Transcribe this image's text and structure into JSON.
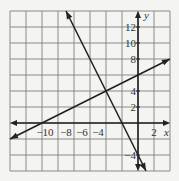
{
  "chart_data": {
    "type": "line",
    "title": "",
    "xlabel": "x",
    "ylabel": "y",
    "xlim": [
      -16,
      4
    ],
    "ylim": [
      -6,
      14
    ],
    "grid": true,
    "grid_step": 2,
    "x_tick_labels": [
      "-10",
      "-8",
      "-6",
      "-4",
      "2"
    ],
    "x_tick_values": [
      -10,
      -8,
      -6,
      -4,
      2
    ],
    "y_tick_labels": [
      "12",
      "10",
      "8",
      "4",
      "2",
      "-4"
    ],
    "y_tick_values": [
      12,
      10,
      8,
      4,
      2,
      -4
    ],
    "series": [
      {
        "name": "line-1",
        "equation": "y = -2x - 4",
        "slope": -2,
        "intercept": -4,
        "points": [
          [
            -9,
            14
          ],
          [
            -4,
            4
          ],
          [
            -2,
            0
          ],
          [
            0,
            -4
          ],
          [
            1,
            -6
          ]
        ]
      },
      {
        "name": "line-2",
        "equation": "y = 0.5x + 6",
        "slope": 0.5,
        "intercept": 6,
        "points": [
          [
            -16,
            -2
          ],
          [
            -12,
            0
          ],
          [
            -4,
            4
          ],
          [
            0,
            6
          ],
          [
            4,
            8
          ]
        ]
      }
    ],
    "intersection": [
      -4,
      4
    ],
    "colors": {
      "line": "#222222",
      "grid": "#8a8a8a",
      "background": "#f4f4f2"
    }
  },
  "labels": {
    "x_axis": "x",
    "y_axis": "y",
    "xt": [
      "−10",
      "−8",
      "−6",
      "−4",
      "2"
    ],
    "yt": [
      "12",
      "10",
      "8",
      "4",
      "2",
      "−4"
    ]
  }
}
